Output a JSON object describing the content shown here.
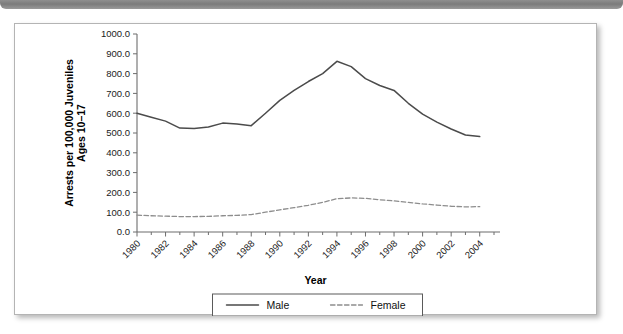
{
  "decor": {
    "top_bar_color": "#8f8f8f",
    "panel_border_color": "#b4b4b4",
    "panel_background": "#ffffff"
  },
  "chart_data": {
    "type": "line",
    "title": "",
    "xlabel": "Year",
    "ylabel": "Arrests per 100,000 Juveniles Ages 10–17",
    "ylabel_line1": "Arrests per 100,000 Juveniles",
    "ylabel_line2": "Ages 10–17",
    "xlim": [
      1980,
      2005
    ],
    "ylim": [
      0.0,
      1000.0
    ],
    "grid": false,
    "legend_position": "bottom-center",
    "y_ticks": [
      "0.0",
      "100.0",
      "200.0",
      "300.0",
      "400.0",
      "500.0",
      "600.0",
      "700.0",
      "800.0",
      "900.0",
      "1000.0"
    ],
    "y_tick_values": [
      0,
      100,
      200,
      300,
      400,
      500,
      600,
      700,
      800,
      900,
      1000
    ],
    "x_tick_labels": [
      "1980",
      "1982",
      "1984",
      "1986",
      "1988",
      "1990",
      "1992",
      "1994",
      "1996",
      "1998",
      "2000",
      "2002",
      "2004"
    ],
    "x_tick_label_values": [
      1980,
      1982,
      1984,
      1986,
      1988,
      1990,
      1992,
      1994,
      1996,
      1998,
      2000,
      2002,
      2004
    ],
    "x_minor_tick_values": [
      1981,
      1983,
      1985,
      1987,
      1989,
      1991,
      1993,
      1995,
      1997,
      1999,
      2001,
      2003,
      2005
    ],
    "x": [
      1980,
      1981,
      1982,
      1983,
      1984,
      1985,
      1986,
      1987,
      1988,
      1989,
      1990,
      1991,
      1992,
      1993,
      1994,
      1995,
      1996,
      1997,
      1998,
      1999,
      2000,
      2001,
      2002,
      2003,
      2004
    ],
    "series": [
      {
        "name": "Male",
        "style": "solid",
        "color": "#4b4b4b",
        "values": [
          600,
          580,
          560,
          525,
          523,
          530,
          550,
          545,
          537,
          600,
          665,
          715,
          760,
          800,
          862,
          835,
          775,
          740,
          715,
          650,
          595,
          555,
          520,
          490,
          482
        ]
      },
      {
        "name": "Female",
        "style": "dashed",
        "color": "#8d8d8d",
        "values": [
          85,
          82,
          80,
          78,
          78,
          79,
          82,
          84,
          88,
          100,
          112,
          123,
          135,
          150,
          168,
          172,
          170,
          163,
          157,
          150,
          142,
          136,
          130,
          127,
          128
        ]
      }
    ],
    "legend": [
      {
        "label": "Male",
        "style": "solid"
      },
      {
        "label": "Female",
        "style": "dashed"
      }
    ]
  }
}
